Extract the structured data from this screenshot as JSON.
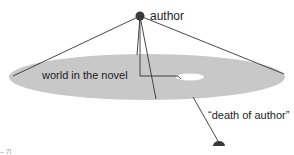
{
  "diagram": {
    "labels": {
      "author": "author",
      "world": "world in the novel",
      "death": "“death of author”",
      "corner": "– 7l"
    },
    "colors": {
      "disk": "#c8c8c8",
      "line": "#333333",
      "node": "#3a3a3a",
      "hole": "#ffffff",
      "text": "#222222"
    }
  }
}
